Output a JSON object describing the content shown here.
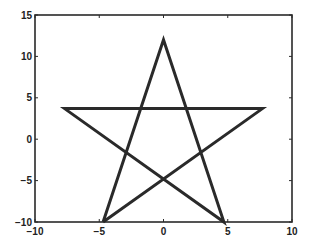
{
  "chart_data": {
    "type": "line",
    "title": "",
    "xlabel": "",
    "ylabel": "",
    "xlim": [
      -10,
      10
    ],
    "ylim": [
      -10,
      15
    ],
    "grid": false,
    "legend": null,
    "x_ticks": [
      -10,
      -5,
      0,
      5,
      10
    ],
    "y_ticks": [
      -10,
      -5,
      0,
      5,
      10,
      15
    ],
    "x_tick_labels": [
      "-10",
      "-5",
      "0",
      "5",
      "10"
    ],
    "y_tick_labels": [
      "-10",
      "-5",
      "0",
      "5",
      "10",
      "15"
    ],
    "series": [
      {
        "name": "star",
        "color": "#2a2a2a",
        "x": [
          -4.7,
          0,
          4.7,
          -7.7,
          7.7,
          -4.7
        ],
        "y": [
          -10,
          12,
          -10,
          3.7,
          3.7,
          -10
        ]
      }
    ]
  }
}
